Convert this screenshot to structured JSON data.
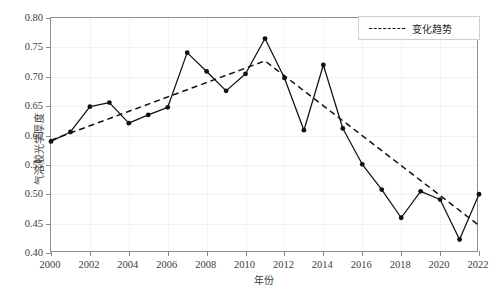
{
  "chart_data": {
    "type": "line",
    "title": "",
    "xlabel": "年份",
    "ylabel": "气溶胶光学厚度",
    "xlim": [
      2000,
      2022
    ],
    "ylim": [
      0.4,
      0.8
    ],
    "ytick_labels": [
      "0.80",
      "0.75",
      "0.70",
      "0.65",
      "0.60",
      "0.55",
      "0.50",
      "0.45",
      "0.40"
    ],
    "ytick_values": [
      0.8,
      0.75,
      0.7,
      0.65,
      0.6,
      0.55,
      0.5,
      0.45,
      0.4
    ],
    "xtick_labels": [
      "2000",
      "2002",
      "2004",
      "2006",
      "2008",
      "2010",
      "2012",
      "2014",
      "2016",
      "2018",
      "2020",
      "2022"
    ],
    "xtick_values": [
      2000,
      2002,
      2004,
      2006,
      2008,
      2010,
      2012,
      2014,
      2016,
      2018,
      2020,
      2022
    ],
    "grid": true,
    "legend_position": "top-right",
    "x": [
      2000,
      2001,
      2002,
      2003,
      2004,
      2005,
      2006,
      2007,
      2008,
      2009,
      2010,
      2011,
      2012,
      2013,
      2014,
      2015,
      2016,
      2017,
      2018,
      2019,
      2020,
      2021,
      2022
    ],
    "series": [
      {
        "name": "气溶胶光学厚度",
        "style": "solid-line-with-markers",
        "color": "#111111",
        "values": [
          0.59,
          0.606,
          0.649,
          0.656,
          0.621,
          0.635,
          0.648,
          0.741,
          0.709,
          0.676,
          0.705,
          0.765,
          0.698,
          0.609,
          0.72,
          0.612,
          0.551,
          0.508,
          0.46,
          0.505,
          0.491,
          0.423,
          0.5
        ]
      },
      {
        "name": "变化趋势",
        "style": "dashed-line",
        "color": "#111111",
        "x": [
          2000,
          2011,
          2022
        ],
        "values": [
          0.592,
          0.727,
          0.447
        ]
      }
    ],
    "legend": [
      {
        "label": "变化趋势",
        "style": "dashed",
        "color": "#111111"
      }
    ]
  },
  "axes": {
    "frame_color": "#8d8d8d",
    "grid_color": "#f1f1f1"
  }
}
